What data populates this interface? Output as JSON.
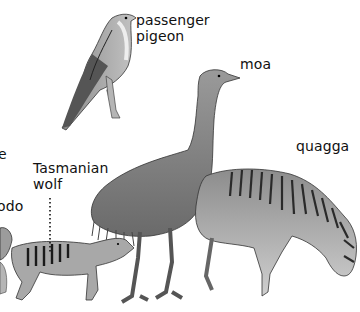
{
  "illustration": {
    "description": "Pencil-style illustration of extinct animals with labels",
    "background": "#ffffff",
    "ink": "#111111",
    "labels": [
      {
        "id": "passenger-pigeon",
        "lines": [
          "passenger",
          "pigeon"
        ]
      },
      {
        "id": "moa",
        "lines": [
          "moa"
        ]
      },
      {
        "id": "quagga",
        "lines": [
          "quagga"
        ]
      },
      {
        "id": "tasmanian-wolf",
        "lines": [
          "Tasmanian",
          "wolf"
        ]
      },
      {
        "id": "dodo-partial",
        "lines": [
          "odo"
        ]
      },
      {
        "id": "partial-e",
        "lines": [
          "e"
        ]
      }
    ],
    "animals": [
      "passenger pigeon",
      "moa",
      "quagga",
      "Tasmanian wolf",
      "dodo"
    ]
  }
}
